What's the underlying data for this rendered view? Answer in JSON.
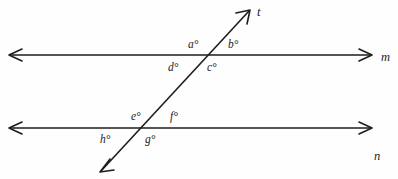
{
  "figure": {
    "background_color": "#fefefe",
    "stroke_color": "#1d1d1d",
    "lines": {
      "m": {
        "name": "m",
        "label": "m",
        "y": 55,
        "x_start": 8,
        "x_end": 373
      },
      "n": {
        "name": "n",
        "label": "n",
        "y": 128,
        "x_start": 8,
        "x_end": 373
      },
      "t": {
        "name": "t",
        "label": "t",
        "x_bottom": 100,
        "y_bottom": 172,
        "x_top": 250,
        "y_top": 10
      }
    },
    "intersections": {
      "upper": {
        "x": 208,
        "y": 55,
        "on_line": "m"
      },
      "lower": {
        "x": 146,
        "y": 128,
        "on_line": "n"
      }
    },
    "angles": [
      {
        "id": "a",
        "label": "a°",
        "x": 193,
        "y": 45,
        "intersection": "upper",
        "position": "above-left"
      },
      {
        "id": "b",
        "label": "b°",
        "x": 233,
        "y": 45,
        "intersection": "upper",
        "position": "above-right"
      },
      {
        "id": "d",
        "label": "d°",
        "x": 173,
        "y": 68,
        "intersection": "upper",
        "position": "below-left"
      },
      {
        "id": "c",
        "label": "c°",
        "x": 212,
        "y": 68,
        "intersection": "upper",
        "position": "below-right"
      },
      {
        "id": "e",
        "label": "e°",
        "x": 137,
        "y": 117,
        "intersection": "lower",
        "position": "above-left"
      },
      {
        "id": "f",
        "label": "f°",
        "x": 175,
        "y": 117,
        "intersection": "lower",
        "position": "above-right"
      },
      {
        "id": "h",
        "label": "h°",
        "x": 105,
        "y": 140,
        "intersection": "lower",
        "position": "below-left"
      },
      {
        "id": "g",
        "label": "g°",
        "x": 150,
        "y": 140,
        "intersection": "lower",
        "position": "below-right"
      }
    ],
    "line_labels": [
      {
        "id": "m",
        "label": "m",
        "x": 381,
        "y": 51
      },
      {
        "id": "n",
        "label": "n",
        "x": 374,
        "y": 150
      },
      {
        "id": "t",
        "label": "t",
        "x": 257,
        "y": 6
      }
    ]
  }
}
